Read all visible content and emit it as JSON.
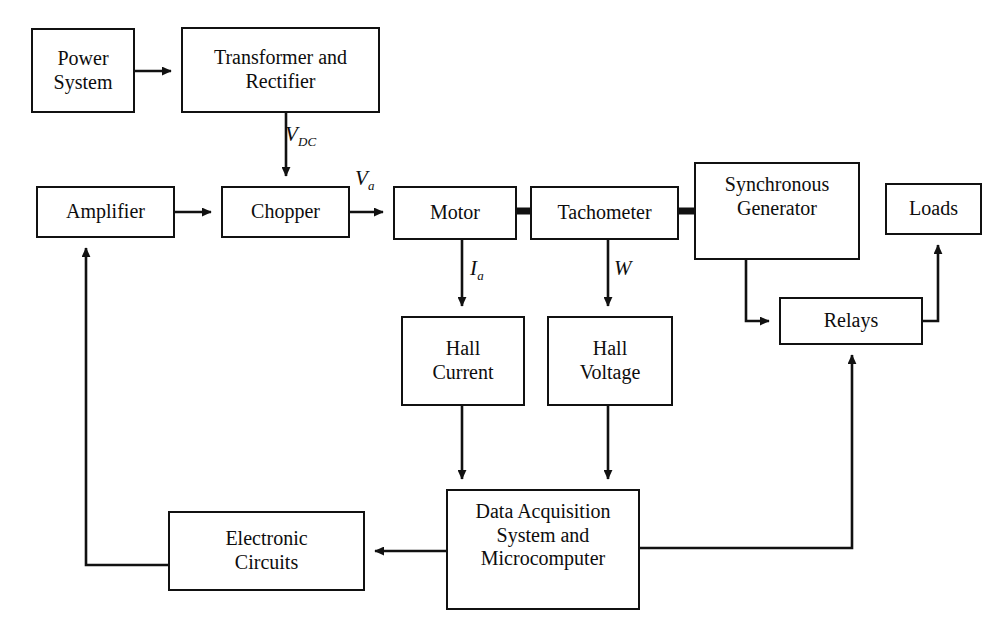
{
  "diagram": {
    "stroke_color": "#111111",
    "background_color": "#ffffff",
    "nodes": [
      {
        "id": "power-system",
        "label": "Power\nSystem",
        "x": 31,
        "y": 28,
        "w": 104,
        "h": 85
      },
      {
        "id": "transformer-rectifier",
        "label": "Transformer and\nRectifier",
        "x": 181,
        "y": 27,
        "w": 199,
        "h": 86
      },
      {
        "id": "amplifier",
        "label": "Amplifier",
        "x": 36,
        "y": 186,
        "w": 139,
        "h": 52
      },
      {
        "id": "chopper",
        "label": "Chopper",
        "x": 221,
        "y": 186,
        "w": 129,
        "h": 52
      },
      {
        "id": "motor",
        "label": "Motor",
        "x": 393,
        "y": 186,
        "w": 124,
        "h": 54
      },
      {
        "id": "tachometer",
        "label": "Tachometer",
        "x": 530,
        "y": 186,
        "w": 149,
        "h": 54
      },
      {
        "id": "synchronous-generator",
        "label": "Synchronous\nGenerator",
        "x": 694,
        "y": 162,
        "w": 166,
        "h": 98
      },
      {
        "id": "loads",
        "label": "Loads",
        "x": 885,
        "y": 183,
        "w": 97,
        "h": 52
      },
      {
        "id": "relays",
        "label": "Relays",
        "x": 779,
        "y": 297,
        "w": 144,
        "h": 48
      },
      {
        "id": "hall-current",
        "label": "Hall\nCurrent",
        "x": 401,
        "y": 316,
        "w": 124,
        "h": 90
      },
      {
        "id": "hall-voltage",
        "label": "Hall\nVoltage",
        "x": 547,
        "y": 316,
        "w": 126,
        "h": 90
      },
      {
        "id": "electronic-circuits",
        "label": "Electronic\nCircuits",
        "x": 168,
        "y": 511,
        "w": 197,
        "h": 80
      },
      {
        "id": "data-acquisition",
        "label": "Data Acquisition\nSystem and\nMicrocomputer",
        "x": 446,
        "y": 489,
        "w": 194,
        "h": 121
      }
    ],
    "edge_labels": [
      {
        "id": "v-dc",
        "base": "V",
        "sub": "DC",
        "x": 285,
        "y": 124
      },
      {
        "id": "v-a",
        "base": "V",
        "sub": "a",
        "x": 355,
        "y": 168
      },
      {
        "id": "i-a",
        "base": "I",
        "sub": "a",
        "x": 470,
        "y": 258
      },
      {
        "id": "w",
        "base": "W",
        "sub": "",
        "x": 614,
        "y": 258
      }
    ],
    "connections": [
      {
        "id": "power-to-transformer",
        "from": "power-system",
        "to": "transformer-rectifier",
        "kind": "arrow"
      },
      {
        "id": "transformer-to-chopper",
        "from": "transformer-rectifier",
        "to": "chopper",
        "kind": "arrow",
        "label": "v-dc"
      },
      {
        "id": "amplifier-to-chopper",
        "from": "amplifier",
        "to": "chopper",
        "kind": "arrow"
      },
      {
        "id": "chopper-to-motor",
        "from": "chopper",
        "to": "motor",
        "kind": "arrow",
        "label": "v-a"
      },
      {
        "id": "motor-to-tachometer",
        "from": "motor",
        "to": "tachometer",
        "kind": "shaft"
      },
      {
        "id": "tachometer-to-generator",
        "from": "tachometer",
        "to": "synchronous-generator",
        "kind": "shaft"
      },
      {
        "id": "motor-to-hall-current",
        "from": "motor",
        "to": "hall-current",
        "kind": "arrow",
        "label": "i-a"
      },
      {
        "id": "tachometer-to-hall-voltage",
        "from": "tachometer",
        "to": "hall-voltage",
        "kind": "arrow",
        "label": "w"
      },
      {
        "id": "generator-to-relays",
        "from": "synchronous-generator",
        "to": "relays",
        "kind": "arrow"
      },
      {
        "id": "relays-to-loads",
        "from": "relays",
        "to": "loads",
        "kind": "arrow"
      },
      {
        "id": "hall-current-to-daq",
        "from": "hall-current",
        "to": "data-acquisition",
        "kind": "arrow"
      },
      {
        "id": "hall-voltage-to-daq",
        "from": "hall-voltage",
        "to": "data-acquisition",
        "kind": "arrow"
      },
      {
        "id": "daq-to-electronic-circuits",
        "from": "data-acquisition",
        "to": "electronic-circuits",
        "kind": "arrow"
      },
      {
        "id": "electronic-circuits-to-amplifier",
        "from": "electronic-circuits",
        "to": "amplifier",
        "kind": "arrow"
      },
      {
        "id": "daq-to-relays",
        "from": "data-acquisition",
        "to": "relays",
        "kind": "arrow"
      }
    ]
  }
}
